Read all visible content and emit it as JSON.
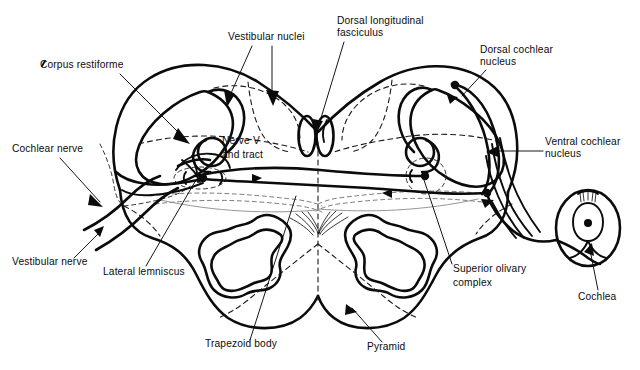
{
  "figure": {
    "background_color": "#ffffff",
    "ink_color": "#0b0b0b",
    "width": 640,
    "height": 370
  },
  "labels": [
    {
      "id": "corpus-restiforme",
      "text": "Corpus restiforme",
      "x": 40,
      "y": 68,
      "anchor": "start"
    },
    {
      "id": "vestibular-nuclei",
      "text": "Vestibular nuclei",
      "x": 228,
      "y": 40,
      "anchor": "start"
    },
    {
      "id": "dorsal-longitudinal-fasciculus-line1",
      "text": "Dorsal longitudinal",
      "x": 337,
      "y": 24,
      "anchor": "start"
    },
    {
      "id": "dorsal-longitudinal-fasciculus-line2",
      "text": "fasciculus",
      "x": 337,
      "y": 36,
      "anchor": "start"
    },
    {
      "id": "dorsal-cochlear-nucleus-line1",
      "text": "Dorsal cochlear",
      "x": 480,
      "y": 53,
      "anchor": "start"
    },
    {
      "id": "dorsal-cochlear-nucleus-line2",
      "text": "nucleus",
      "x": 480,
      "y": 65,
      "anchor": "start"
    },
    {
      "id": "ventral-cochlear-nucleus-line1",
      "text": "Ventral cochlear",
      "x": 545,
      "y": 145,
      "anchor": "start"
    },
    {
      "id": "ventral-cochlear-nucleus-line2",
      "text": "nucleus",
      "x": 545,
      "y": 157,
      "anchor": "start"
    },
    {
      "id": "cochlear-nerve",
      "text": "Cochlear nerve",
      "x": 12,
      "y": 152,
      "anchor": "start"
    },
    {
      "id": "nerve-v-and-tract-line1",
      "text": "Nerve V",
      "x": 222,
      "y": 144,
      "anchor": "start"
    },
    {
      "id": "nerve-v-and-tract-line2",
      "text": "and tract",
      "x": 222,
      "y": 158,
      "anchor": "start"
    },
    {
      "id": "vestibular-nerve",
      "text": "Vestibular nerve",
      "x": 12,
      "y": 265,
      "anchor": "start"
    },
    {
      "id": "lateral-lemniscus",
      "text": "Lateral lemniscus",
      "x": 103,
      "y": 275,
      "anchor": "start"
    },
    {
      "id": "trapezoid-body",
      "text": "Trapezoid body",
      "x": 205,
      "y": 347,
      "anchor": "start"
    },
    {
      "id": "pyramid",
      "text": "Pyramid",
      "x": 367,
      "y": 350,
      "anchor": "start"
    },
    {
      "id": "superior-olivary-complex-line1",
      "text": "Superior olivary",
      "x": 453,
      "y": 272,
      "anchor": "start"
    },
    {
      "id": "superior-olivary-complex-line2",
      "text": "complex",
      "x": 453,
      "y": 286,
      "anchor": "start"
    },
    {
      "id": "cochlea",
      "text": "Cochlea",
      "x": 578,
      "y": 300,
      "anchor": "start"
    }
  ],
  "structures": [
    {
      "id": "brainstem-outline",
      "name": "Brainstem transverse section outline"
    },
    {
      "id": "corpus-restiforme-left",
      "name": "Corpus restiforme (inferior cerebellar peduncle), left"
    },
    {
      "id": "corpus-restiforme-right",
      "name": "Corpus restiforme (inferior cerebellar peduncle), right"
    },
    {
      "id": "vestibular-nuclei-region",
      "name": "Vestibular nuclei dashed region"
    },
    {
      "id": "dorsal-longitudinal-fasciculus",
      "name": "Dorsal longitudinal fasciculus, paired ovals"
    },
    {
      "id": "dorsal-cochlear-nucleus",
      "name": "Dorsal cochlear nucleus"
    },
    {
      "id": "ventral-cochlear-nucleus",
      "name": "Ventral cochlear nucleus"
    },
    {
      "id": "nerve-v-and-tract-left",
      "name": "Spinal nucleus and tract of nerve V, left"
    },
    {
      "id": "nerve-v-and-tract-right",
      "name": "Spinal nucleus and tract of nerve V, right"
    },
    {
      "id": "superior-olivary-complex-left",
      "name": "Superior olivary complex, left"
    },
    {
      "id": "superior-olivary-complex-right",
      "name": "Superior olivary complex, right"
    },
    {
      "id": "inferior-olive-left",
      "name": "Inferior olivary nucleus, left"
    },
    {
      "id": "inferior-olive-right",
      "name": "Inferior olivary nucleus, right"
    },
    {
      "id": "pyramid-left",
      "name": "Pyramid, left"
    },
    {
      "id": "pyramid-right",
      "name": "Pyramid, right"
    },
    {
      "id": "trapezoid-body-fibers",
      "name": "Trapezoid body decussating fibers"
    },
    {
      "id": "lateral-lemniscus-left",
      "name": "Lateral lemniscus, left"
    },
    {
      "id": "cochlea",
      "name": "Cochlea with hair cell"
    },
    {
      "id": "cochlear-nerve-fibers",
      "name": "Cochlear nerve fibers"
    },
    {
      "id": "vestibular-nerve-fibers",
      "name": "Vestibular nerve fibers"
    }
  ]
}
